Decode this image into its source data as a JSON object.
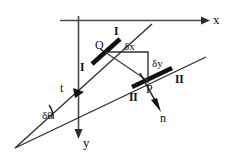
{
  "figure": {
    "kind": "geometry-diagram",
    "width": 238,
    "height": 160,
    "background_color": "#ffffff",
    "ink_color": "#111111",
    "axis_color": "#4a4a4a"
  },
  "axes": {
    "x": {
      "label": "x",
      "direction": "right",
      "from": [
        60,
        20
      ],
      "to": [
        207,
        20
      ]
    },
    "y": {
      "label": "y",
      "direction": "down",
      "from": [
        78,
        16
      ],
      "to": [
        78,
        136
      ]
    }
  },
  "points": {
    "Q": {
      "label": "Q",
      "x": 105,
      "y": 52
    },
    "P": {
      "label": "P",
      "x": 148,
      "y": 80
    },
    "vertex": {
      "label": "",
      "x": 15,
      "y": 148
    }
  },
  "lines": [
    {
      "name": "line-I",
      "roman": "I",
      "from": [
        15,
        148
      ],
      "to": [
        152,
        24
      ]
    },
    {
      "name": "line-II",
      "roman": "II",
      "from": [
        15,
        148
      ],
      "to": [
        206,
        57
      ]
    }
  ],
  "labels": {
    "roman_I_upper": "I",
    "roman_I_lower": "I",
    "roman_II_right": "II",
    "roman_II_lower": "II",
    "delta_x": "δx",
    "delta_y": "δy",
    "delta_theta": "δθ",
    "tangent": "t",
    "normal": "n",
    "point_q": "Q",
    "point_p": "P",
    "axis_x": "x",
    "axis_y": "y"
  },
  "vectors": {
    "tangent": {
      "symbol": "t",
      "at": [
        78,
        93
      ],
      "along": "line-I",
      "direction": "down-left"
    },
    "normal": {
      "symbol": "n",
      "from": [
        148,
        80
      ],
      "to": [
        160,
        110
      ],
      "direction": "down-right"
    }
  },
  "angle": {
    "symbol": "δθ",
    "at_vertex": [
      15,
      148
    ],
    "between": [
      "line-I",
      "line-II"
    ]
  },
  "components": {
    "delta_x": {
      "symbol": "δx",
      "from": [
        105,
        52
      ],
      "to": [
        148,
        52
      ]
    },
    "delta_y": {
      "symbol": "δy",
      "from": [
        148,
        52
      ],
      "to": [
        148,
        82
      ]
    },
    "chord_QP": {
      "from": [
        105,
        52
      ],
      "to": [
        148,
        80
      ]
    }
  }
}
